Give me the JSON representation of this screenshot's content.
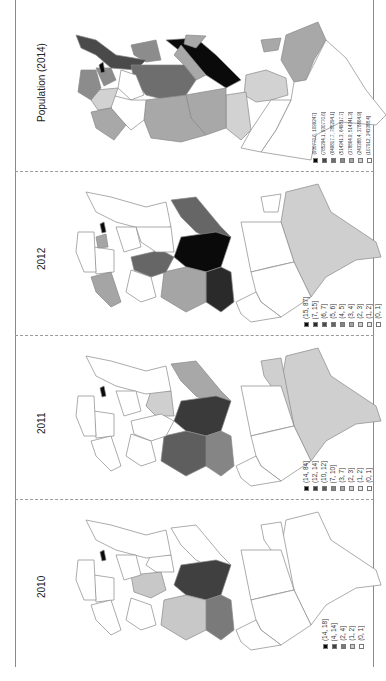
{
  "figure": {
    "orientation": "rotated 90 degrees counter-clockwise",
    "panels": [
      {
        "id": "population",
        "title": "Population (2014)",
        "legend": [
          {
            "label": "(930770.6, 1099247]",
            "color": "#0a0a0a"
          },
          {
            "label": "(785294.1, 930770.6]",
            "color": "#4a4a4a"
          },
          {
            "label": "(649817.7, 785294.1]",
            "color": "#6e6e6e"
          },
          {
            "label": "(514341.3, 649817.7]",
            "color": "#8c8c8c"
          },
          {
            "label": "(378864.9, 514341.3]",
            "color": "#a8a8a8"
          },
          {
            "label": "(243388.4, 378864.9]",
            "color": "#d2d2d2"
          },
          {
            "label": "(107912, 243388.4]",
            "color": "#ffffff"
          }
        ]
      },
      {
        "id": "2012",
        "title": "2012",
        "legend": [
          {
            "label": "(15, 87]",
            "color": "#0a0a0a"
          },
          {
            "label": "(7, 15]",
            "color": "#2a2a2a"
          },
          {
            "label": "(6, 7]",
            "color": "#4a4a4a"
          },
          {
            "label": "(5, 6]",
            "color": "#666666"
          },
          {
            "label": "(4, 5]",
            "color": "#858585"
          },
          {
            "label": "(3, 4]",
            "color": "#a5a5a5"
          },
          {
            "label": "(2, 3]",
            "color": "#cfcfcf"
          },
          {
            "label": "(1, 2]",
            "color": "#ebebeb"
          },
          {
            "label": "(0, 1]",
            "color": "#ffffff"
          }
        ]
      },
      {
        "id": "2011",
        "title": "2011",
        "legend": [
          {
            "label": "(14, 84]",
            "color": "#0a0a0a"
          },
          {
            "label": "(12, 14]",
            "color": "#3a3a3a"
          },
          {
            "label": "(10, 12]",
            "color": "#5e5e5e"
          },
          {
            "label": "(7, 10]",
            "color": "#858585"
          },
          {
            "label": "(3, 7]",
            "color": "#a8a8a8"
          },
          {
            "label": "(2, 3]",
            "color": "#cfcfcf"
          },
          {
            "label": "(1, 2]",
            "color": "#ebebeb"
          },
          {
            "label": "(0, 1]",
            "color": "#ffffff"
          }
        ]
      },
      {
        "id": "2010",
        "title": "2010",
        "legend": [
          {
            "label": "(14, 18]",
            "color": "#0a0a0a"
          },
          {
            "label": "(4, 14]",
            "color": "#404040"
          },
          {
            "label": "(2, 4]",
            "color": "#7a7a7a"
          },
          {
            "label": "(1, 2]",
            "color": "#c8c8c8"
          },
          {
            "label": "(0, 1]",
            "color": "#ffffff"
          }
        ]
      }
    ]
  }
}
